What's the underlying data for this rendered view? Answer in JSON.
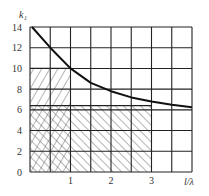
{
  "chart_data": {
    "type": "line",
    "title": "",
    "xlabel": "l/λ",
    "ylabel": "k₁",
    "xlim": [
      0,
      4
    ],
    "ylim": [
      0,
      14
    ],
    "grid": true,
    "grid_x_step": 0.5,
    "grid_y_step": 2,
    "x_ticks": [
      "1",
      "2",
      "3"
    ],
    "x_tick_values": [
      1,
      2,
      3
    ],
    "y_ticks": [
      "0",
      "2",
      "4",
      "6",
      "8",
      "10",
      "12",
      "14"
    ],
    "y_tick_values": [
      0,
      2,
      4,
      6,
      8,
      10,
      12,
      14
    ],
    "series": [
      {
        "name": "k1 curve",
        "x": [
          0.05,
          0.5,
          1.0,
          1.5,
          2.0,
          2.5,
          3.0,
          3.5,
          4.0
        ],
        "y": [
          14,
          12,
          10,
          8.6,
          7.8,
          7.2,
          6.8,
          6.5,
          6.25
        ]
      }
    ],
    "regions": [
      {
        "name": "forward-hatch region",
        "pattern": "/",
        "x": [
          0,
          1
        ],
        "y": [
          0,
          10
        ]
      },
      {
        "name": "back-hatch region",
        "pattern": "\\",
        "x": [
          0,
          3
        ],
        "y": [
          0,
          6.4
        ]
      }
    ],
    "legend": null
  },
  "axis": {
    "xlabel": "l/λ",
    "ylabel": "k₁"
  }
}
